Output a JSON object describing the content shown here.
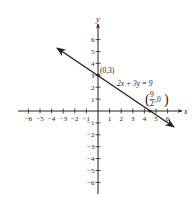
{
  "chart_data": {
    "type": "line",
    "title": "",
    "xlabel": "x",
    "ylabel": "y",
    "xlim": [
      -6,
      6
    ],
    "ylim": [
      -6,
      6
    ],
    "grid": false,
    "x_ticks": [
      -6,
      -5,
      -4,
      -3,
      -2,
      -1,
      1,
      2,
      3,
      4,
      5,
      6
    ],
    "y_ticks": [
      -6,
      -5,
      -4,
      -3,
      -2,
      -1,
      1,
      2,
      3,
      4,
      5,
      6
    ],
    "x_tick_labels": [
      "-6",
      "-5",
      "-4",
      "-3",
      "-2",
      "-1",
      "1",
      "2",
      "3",
      "4",
      "5",
      "6"
    ],
    "y_tick_labels": [
      "-6",
      "-5",
      "-4",
      "-3",
      "-2",
      "-1",
      "1",
      "2",
      "3",
      "4",
      "5",
      "6"
    ],
    "series": [
      {
        "name": "2x+3y=9",
        "equation": "2x + 3y = 9",
        "slope": -0.6667,
        "y_intercept": 3,
        "x_intercept": 4.5,
        "x": [
          -3.5,
          0,
          4.5,
          6.5
        ],
        "y": [
          5.333,
          3,
          0,
          -1.333
        ],
        "arrows": "both"
      }
    ],
    "annotations": [
      {
        "text": "(0,3)",
        "x": 0,
        "y": 3
      },
      {
        "text": "2x+3y=9",
        "x": 1.5,
        "y": 2.2
      },
      {
        "text": "(9/2, 0)",
        "numerator": "9",
        "denominator": "2",
        "x": 4.5,
        "y": 0
      }
    ]
  },
  "labels": {
    "x_axis": "x",
    "y_axis": "y",
    "point_a": "(0,3)",
    "equation": "2x + 3y = 9",
    "point_b_num": "9",
    "point_b_den": "2",
    "point_b_y": ",0"
  }
}
